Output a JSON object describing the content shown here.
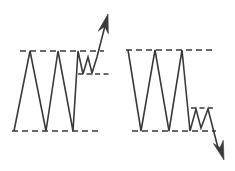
{
  "figure": {
    "title": "",
    "background_color": "#ffffff",
    "stroke_color": "#3a3a3a",
    "width": 235,
    "height": 171
  },
  "chart_data": {
    "type": "line",
    "title": "",
    "subtitle": "",
    "xlabel": "",
    "ylabel": "",
    "xlim": [
      0,
      235
    ],
    "ylim": [
      171,
      0
    ],
    "grid": false,
    "legend": null,
    "annotations": [],
    "panels": [
      {
        "name": "bullish-rectangle-breakout",
        "direction": "up",
        "resistance_level": 51,
        "support_level": 131,
        "consolidation_upper_level": 51,
        "consolidation_lower_level": 74,
        "series": [
          {
            "name": "price",
            "points": [
              [
                14,
                131
              ],
              [
                30,
                51
              ],
              [
                46,
                131
              ],
              [
                58,
                51
              ],
              [
                73,
                131
              ],
              [
                78,
                51
              ],
              [
                83,
                74
              ],
              [
                88,
                57
              ],
              [
                92,
                73
              ],
              [
                97,
                57
              ],
              [
                106,
                22
              ]
            ]
          }
        ],
        "breakout_arrow": {
          "from": [
            97,
            57
          ],
          "to": [
            108,
            14
          ],
          "direction": "up"
        },
        "boundaries": [
          {
            "name": "resistance",
            "x1": 20,
            "x2": 104,
            "y": 51
          },
          {
            "name": "support",
            "x1": 12,
            "x2": 100,
            "y": 131
          },
          {
            "name": "consolidation-lower",
            "x1": 78,
            "x2": 110,
            "y": 74
          }
        ]
      },
      {
        "name": "bearish-rectangle-breakdown",
        "direction": "down",
        "resistance_level": 50,
        "support_level": 131,
        "consolidation_upper_level": 108,
        "consolidation_lower_level": 131,
        "series": [
          {
            "name": "price",
            "points": [
              [
                128,
                50
              ],
              [
                141,
                131
              ],
              [
                155,
                50
              ],
              [
                169,
                131
              ],
              [
                182,
                50
              ],
              [
                190,
                131
              ],
              [
                196,
                109
              ],
              [
                201,
                128
              ],
              [
                208,
                109
              ],
              [
                218,
                148
              ]
            ]
          }
        ],
        "breakout_arrow": {
          "from": [
            208,
            109
          ],
          "to": [
            224,
            160
          ],
          "direction": "down"
        },
        "boundaries": [
          {
            "name": "resistance",
            "x1": 126,
            "x2": 214,
            "y": 50
          },
          {
            "name": "support",
            "x1": 132,
            "x2": 216,
            "y": 131
          },
          {
            "name": "consolidation-upper",
            "x1": 191,
            "x2": 215,
            "y": 108
          }
        ]
      }
    ]
  }
}
